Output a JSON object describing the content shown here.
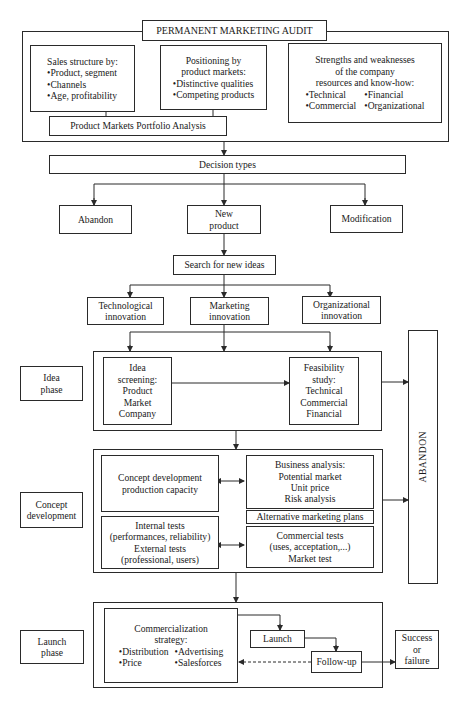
{
  "audit": {
    "title": "PERMANENT MARKETING AUDIT",
    "sales_structure": {
      "heading": "Sales structure by:",
      "items": [
        "Product, segment",
        "Channels",
        "Age, profitability"
      ]
    },
    "positioning": {
      "heading_line1": "Positioning by",
      "heading_line2": "product markets:",
      "items": [
        "Distinctive qualities",
        "Competing products"
      ]
    },
    "strengths": {
      "heading_line1": "Strengths and weaknesses",
      "heading_line2": "of the company",
      "heading_line3": "resources and know-how:",
      "items": [
        "Technical",
        "Financial",
        "Commercial",
        "Organizational"
      ]
    },
    "portfolio": "Product Markets Portfolio Analysis"
  },
  "decision": {
    "title": "Decision types",
    "options": {
      "abandon": "Abandon",
      "new_product_line1": "New",
      "new_product_line2": "product",
      "modification": "Modification"
    }
  },
  "search": "Search for new ideas",
  "innovation": {
    "technological": [
      "Technological",
      "innovation"
    ],
    "marketing": [
      "Marketing",
      "innovation"
    ],
    "organizational": [
      "Organizational",
      "innovation"
    ]
  },
  "phases": {
    "idea": {
      "label": [
        "Idea",
        "phase"
      ],
      "screening": [
        "Idea",
        "screening:",
        "Product",
        "Market",
        "Company"
      ],
      "feasibility": [
        "Feasibility",
        "study:",
        "Technical",
        "Commercial",
        "Financial"
      ]
    },
    "concept": {
      "label": [
        "Concept",
        "development"
      ],
      "concept_dev": [
        "Concept development",
        "production capacity"
      ],
      "business": [
        "Business analysis:",
        "Potential market",
        "Unit price",
        "Risk analysis"
      ],
      "alt_plans": "Alternative marketing plans",
      "tests": [
        "Internal tests",
        "(performances, reliability)",
        "External tests",
        "(professional, users)"
      ],
      "commercial_tests": [
        "Commercial tests",
        "(uses, acceptation,...)",
        "Market test"
      ]
    },
    "launch": {
      "label": [
        "Launch",
        "phase"
      ],
      "strategy_heading": [
        "Commercialization",
        "strategy:"
      ],
      "strategy_items": [
        "Distribution",
        "Advertising",
        "Price",
        "Salesforces"
      ],
      "launch": "Launch",
      "follow_up": "Follow-up",
      "outcome": [
        "Success",
        "or",
        "failure"
      ]
    }
  },
  "abandon_vertical": "ABANDON",
  "bullet": "•"
}
